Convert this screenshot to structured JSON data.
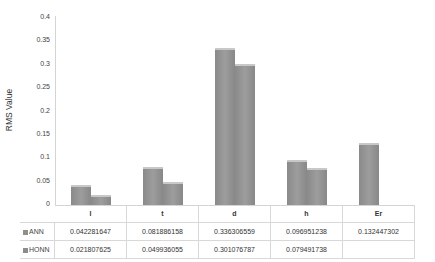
{
  "chart_data": {
    "type": "bar",
    "title": "",
    "xlabel": "",
    "ylabel": "RMS Value",
    "ylim": [
      0,
      0.4
    ],
    "yticks": [
      "0",
      "0.05",
      "0.1",
      "0.15",
      "0.2",
      "0.25",
      "0.3",
      "0.35",
      "0.4"
    ],
    "categories": [
      "l",
      "t",
      "d",
      "h",
      "Er"
    ],
    "series": [
      {
        "name": "ANN",
        "values": [
          0.042281647,
          0.081886158,
          0.336306559,
          0.096951238,
          0.132447302
        ],
        "labels": [
          "0.042281647",
          "0.081886158",
          "0.336306559",
          "0.096951238",
          "0.132447302"
        ]
      },
      {
        "name": "HONN",
        "values": [
          0.021807625,
          0.049936055,
          0.301076787,
          0.079491738,
          null
        ],
        "labels": [
          "0.021807625",
          "0.049936055",
          "0.301076787",
          "0.079491738",
          ""
        ]
      }
    ],
    "legend_position": "data-table",
    "grid": false
  },
  "colors": {
    "ann": "#8f8f8f",
    "honn": "#8c8c8c"
  }
}
